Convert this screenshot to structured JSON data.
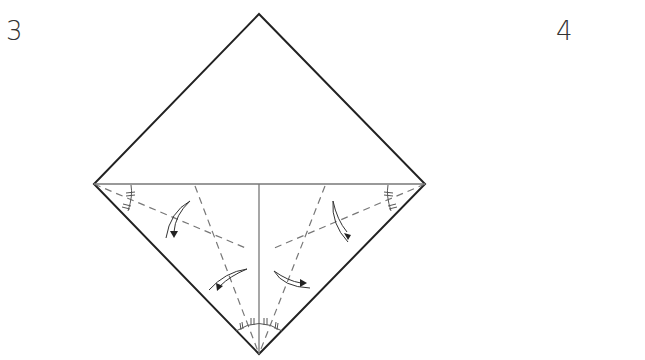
{
  "steps": [
    {
      "number": "3"
    },
    {
      "number": "4"
    }
  ],
  "diagram": {
    "shape": "square-diamond",
    "vertices": {
      "top": [
        259,
        14
      ],
      "left": [
        94,
        184
      ],
      "right": [
        425,
        184
      ],
      "bottom": [
        259,
        354
      ]
    },
    "lines": {
      "outline_color": "#222222",
      "crease_color": "#777777",
      "dashed_color": "#777777"
    },
    "creases": [
      "horizontal-diagonal",
      "vertical-half-lower"
    ],
    "valley_folds": [
      "left-corner-bisector",
      "right-corner-bisector",
      "bottom-left-bisector",
      "bottom-right-bisector"
    ],
    "angle_marks": [
      "left-corner",
      "right-corner",
      "bottom-corner"
    ],
    "fold_arrows": 4
  }
}
